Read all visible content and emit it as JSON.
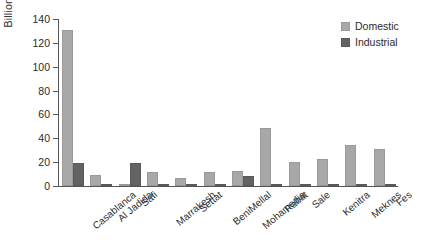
{
  "chart_data": {
    "type": "bar",
    "title": "",
    "xlabel": "",
    "ylabel": "Billion Cubic Meters",
    "ylim": [
      0,
      140
    ],
    "yticks": [
      0,
      20,
      40,
      60,
      80,
      100,
      120,
      140
    ],
    "grid": false,
    "legend_position": "top-right",
    "categories": [
      "Casablanca",
      "Al Jadida",
      "Safi",
      "Marrakesh",
      "Settat",
      "BeniMellal",
      "Mohamedia",
      "Rabat",
      "Sale",
      "Kenitra",
      "Meknes",
      "Fes"
    ],
    "series": [
      {
        "name": "Domestic",
        "color": "#a8a8a8",
        "values": [
          131,
          9,
          1,
          12,
          7,
          12,
          13,
          49,
          20,
          23,
          34,
          31
        ]
      },
      {
        "name": "Industrial",
        "color": "#636363",
        "values": [
          19,
          2,
          19,
          1,
          0,
          1,
          8,
          2,
          1,
          2,
          1,
          1
        ]
      }
    ]
  },
  "legend": {
    "items": [
      {
        "label": "Domestic",
        "color": "#a8a8a8"
      },
      {
        "label": "Industrial",
        "color": "#636363"
      }
    ]
  }
}
